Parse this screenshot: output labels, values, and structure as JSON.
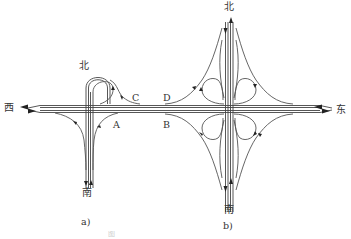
{
  "diagram": {
    "type": "highway-interchange-schematic",
    "panels": [
      {
        "id": "a",
        "label": "a)",
        "description": "Partial cloverleaf / loop interchange on west side",
        "directions": {
          "north": "北",
          "west": "西",
          "south": "南"
        },
        "points": [
          "A",
          "B",
          "C",
          "D"
        ]
      },
      {
        "id": "b",
        "label": "b)",
        "description": "Full cloverleaf interchange",
        "directions": {
          "north": "北",
          "east": "东",
          "south": "南"
        }
      }
    ],
    "labels": {
      "north_a": "北",
      "west": "西",
      "south_a": "南",
      "panel_a": "a)",
      "north_b": "北",
      "east": "东",
      "south_b": "南",
      "panel_b": "b)",
      "point_a": "A",
      "point_b": "B",
      "point_c": "C",
      "point_d": "D"
    },
    "caption": "图"
  },
  "colors": {
    "line": "#444444",
    "background": "#ffffff",
    "caption": "#cfcfcf"
  }
}
